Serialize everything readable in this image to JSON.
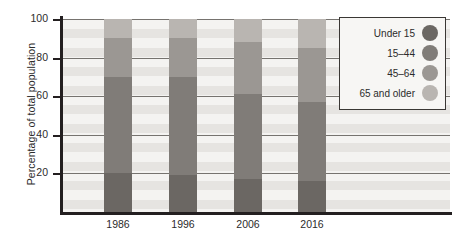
{
  "chart_data": {
    "type": "bar",
    "subtype": "stacked-bar",
    "title": "",
    "xlabel": "",
    "ylabel": "Percentage of total population",
    "categories": [
      "1986",
      "1996",
      "2006",
      "2016"
    ],
    "ylim": [
      0,
      100
    ],
    "yticks": [
      0,
      20,
      40,
      60,
      80,
      100
    ],
    "ytick_labels": [
      "",
      "20",
      "40",
      "60",
      "80",
      "100"
    ],
    "grid": true,
    "grid_axis": "y",
    "legend_position": "top-right",
    "stack_order_bottom_to_top": [
      "Under 15",
      "15–44",
      "45–64",
      "65 and older"
    ],
    "series": [
      {
        "name": "Under 15",
        "color": "#6b6763",
        "values": [
          20,
          19,
          17,
          16
        ]
      },
      {
        "name": "15–44",
        "color": "#807c78",
        "values": [
          50,
          51,
          44,
          41
        ]
      },
      {
        "name": "45–64",
        "color": "#9b9793",
        "values": [
          20,
          20,
          27,
          28
        ]
      },
      {
        "name": "65 and older",
        "color": "#b9b5b1",
        "values": [
          10,
          10,
          12,
          15
        ]
      }
    ],
    "cumulative_tops": [
      [
        20,
        70,
        90,
        100
      ],
      [
        19,
        70,
        90,
        100
      ],
      [
        17,
        61,
        88,
        100
      ],
      [
        16,
        57,
        85,
        100
      ]
    ]
  },
  "axis": {
    "y_title": "Percentage of total population",
    "y_tick_labels": [
      "100",
      "80",
      "60",
      "40",
      "20"
    ],
    "y_tick_values": [
      100,
      80,
      60,
      40,
      20
    ],
    "x_tick_labels": [
      "1986",
      "1996",
      "2006",
      "2016"
    ]
  },
  "legend": {
    "items": [
      {
        "label": "Under 15",
        "color": "#6b6763"
      },
      {
        "label": "15–44",
        "color": "#807c78"
      },
      {
        "label": "45–64",
        "color": "#9b9793"
      },
      {
        "label": "65 and older",
        "color": "#b9b5b1"
      }
    ]
  },
  "colors": {
    "plot_background": "#f2f1ef",
    "band_light": "#f4f3f1",
    "band_dark": "#e6e4e1",
    "axis_line": "#231f20",
    "gridline": "#76736f",
    "text": "#2b2b2b",
    "legend_background": "#f7f6f4",
    "legend_border": "#3a3734"
  }
}
